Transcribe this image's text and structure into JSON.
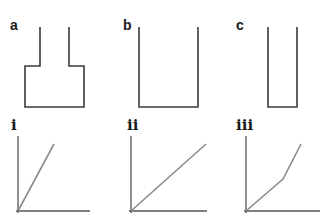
{
  "containers": [
    {
      "label": "a",
      "shape": "narrow-neck-wide-base"
    },
    {
      "label": "b",
      "shape": "wide-cylinder"
    },
    {
      "label": "c",
      "shape": "narrow-cylinder"
    }
  ],
  "graphs": [
    {
      "label": "i",
      "shape": "steep-straight-line"
    },
    {
      "label": "ii",
      "shape": "shallow-straight-line"
    },
    {
      "label": "iii",
      "shape": "shallow-then-steep-line"
    }
  ],
  "colors": {
    "container_stroke": "#3a3a3a",
    "axis_stroke": "#555555",
    "line_stroke": "#8a8a8a"
  }
}
